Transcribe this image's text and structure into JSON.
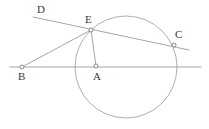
{
  "figure": {
    "width": 209,
    "height": 129,
    "background_color": "#ffffff",
    "stroke_color": "#8e8e8e",
    "label_color": "#3a3a3a",
    "marker_fill": "#ffffff"
  },
  "points": [
    {
      "id": "D",
      "label": "D",
      "label_x": 37,
      "label_y": 4,
      "marker": false,
      "x": 33,
      "y": 17
    },
    {
      "id": "E",
      "label": "E",
      "label_x": 85,
      "label_y": 14,
      "marker": true,
      "x": 91,
      "y": 30
    },
    {
      "id": "C",
      "label": "C",
      "label_x": 175,
      "label_y": 29,
      "marker": true,
      "x": 174,
      "y": 45
    },
    {
      "id": "B",
      "label": "B",
      "label_x": 18,
      "label_y": 71,
      "marker": true,
      "x": 22,
      "y": 67
    },
    {
      "id": "A",
      "label": "A",
      "label_x": 93,
      "label_y": 71,
      "marker": true,
      "x": 96,
      "y": 66
    }
  ],
  "circle": {
    "name": "main-circle",
    "cx": 126,
    "cy": 67,
    "r": 51
  },
  "segments": [
    {
      "name": "line-d-c",
      "from": "D",
      "to": "C",
      "x1": 33,
      "y1": 17,
      "x2": 189,
      "y2": 50
    },
    {
      "name": "line-b-horizontal",
      "from": "B",
      "to": "right-edge",
      "x1": 10,
      "y1": 67,
      "x2": 201,
      "y2": 67
    },
    {
      "name": "segment-b-e",
      "from": "B",
      "to": "E",
      "x1": 22,
      "y1": 67,
      "x2": 91,
      "y2": 30
    },
    {
      "name": "segment-e-a",
      "from": "E",
      "to": "A",
      "x1": 91,
      "y1": 30,
      "x2": 96,
      "y2": 66
    }
  ]
}
